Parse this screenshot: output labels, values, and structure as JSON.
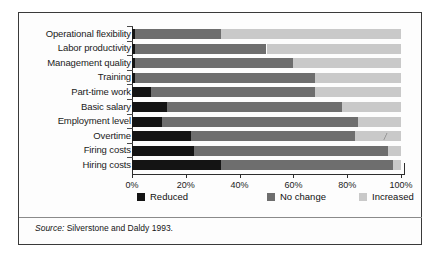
{
  "figure": {
    "source_prefix": "Source:",
    "source_text": " Silverstone and Daldy 1993."
  },
  "colors": {
    "reduced": "#141414",
    "no_change": "#6e6e6e",
    "increased": "#c9c9c9",
    "axis": "#2d2d2d",
    "border": "#3a3a3a"
  },
  "chart_data": {
    "type": "bar",
    "orientation": "horizontal",
    "stacked": true,
    "normalized_percent": true,
    "title": "",
    "xlabel": "",
    "ylabel": "",
    "xlim": [
      0,
      100
    ],
    "xticks": [
      0,
      20,
      40,
      60,
      80,
      100
    ],
    "xtick_labels": [
      "0%",
      "20%",
      "40%",
      "60%",
      "80%",
      "100%"
    ],
    "grid": false,
    "legend_position": "bottom",
    "categories": [
      "Operational flexibility",
      "Labor productivity",
      "Management quality",
      "Training",
      "Part-time work",
      "Basic salary",
      "Employment level",
      "Overtime",
      "Firing costs",
      "Hiring costs"
    ],
    "series": [
      {
        "name": "Reduced",
        "color": "#141414",
        "values": [
          1,
          1,
          1,
          1,
          7,
          13,
          11,
          22,
          23,
          33
        ]
      },
      {
        "name": "No change",
        "color": "#6e6e6e",
        "values": [
          32,
          49,
          59,
          67,
          61,
          65,
          73,
          61,
          72,
          64
        ]
      },
      {
        "name": "Increased",
        "color": "#c9c9c9",
        "values": [
          67,
          50,
          40,
          32,
          32,
          22,
          16,
          17,
          5,
          3
        ]
      }
    ]
  }
}
